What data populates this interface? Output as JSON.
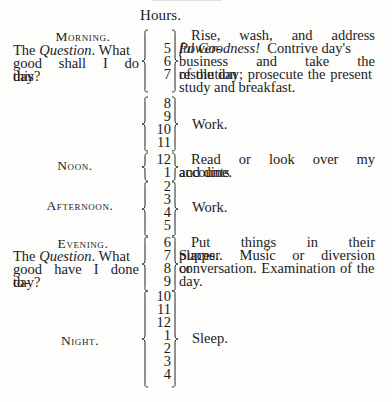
{
  "document": {
    "column_header": "Hours.",
    "periods": [
      {
        "label": "Morning.",
        "question_prefix": "The ",
        "question_word": "Question",
        "question_suffix": ". What good shall I do this day?",
        "hours": [
          "5",
          "6",
          "7"
        ],
        "activity_lead": "Rise, wash, and address ",
        "activity_italic": "Powerful Goodness!",
        "activity_rest": " Contrive day's business and take the resolution of the day; prosecute the present study and breakfast."
      },
      {
        "label": "",
        "hours": [
          "8",
          "9",
          "10",
          "11"
        ],
        "activity": "Work."
      },
      {
        "label": "Noon.",
        "hours": [
          "12",
          "1"
        ],
        "activity": "Read or look over my accounts and dine."
      },
      {
        "label": "Afternoon.",
        "hours": [
          "2",
          "3",
          "4",
          "5"
        ],
        "activity": "Work."
      },
      {
        "label": "Evening.",
        "question_prefix": "The ",
        "question_word": "Question",
        "question_suffix": ". What good have I done today?",
        "question_display": "good have I done to-",
        "question_last": "day?",
        "hours": [
          "6",
          "7",
          "8",
          "9"
        ],
        "activity": "Put things in their places. Supper. Music or diversion or conversation. Examination of the day."
      },
      {
        "label": "Night.",
        "hours": [
          "10",
          "11",
          "12",
          "1",
          "2",
          "3",
          "4"
        ],
        "activity": "Sleep."
      }
    ],
    "morning_lines": {
      "q1": "The ",
      "q1_italic": "Question",
      "q1_end": ". What",
      "q2": "good shall I do this",
      "q3": "day?",
      "a1": "Rise, wash, and address ",
      "a1_italic": "Power-",
      "a2_italic": "ful Goodness!",
      "a2_end": "  Contrive day's",
      "a3": "business and take the resolution",
      "a4": "of the day; prosecute the present",
      "a5": "study and breakfast."
    },
    "evening_lines": {
      "q1": "The ",
      "q1_italic": "Question",
      "q1_end": ". What",
      "q2": "good have I done to-",
      "q3": "day?",
      "a1": "Put things in their places.",
      "a2": "Supper. Music or diversion or",
      "a3": "conversation. Examination of the",
      "a4": "day."
    },
    "noon_lines": {
      "a1": "Read or look over my accounts",
      "a2": "and dine."
    }
  }
}
